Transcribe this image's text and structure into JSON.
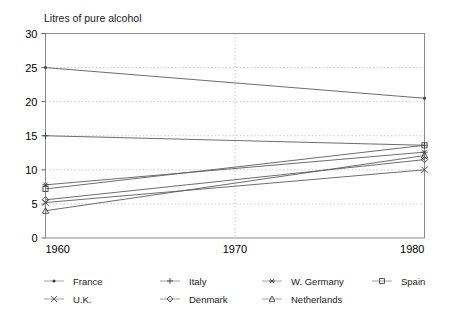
{
  "chart_data": {
    "type": "line",
    "title": "Litres of pure alcohol",
    "xlabel": "",
    "ylabel": "Litres of pure alcohol",
    "x": [
      1960,
      1980
    ],
    "xticks": [
      1960,
      1970,
      1980
    ],
    "yticks": [
      0,
      5,
      10,
      15,
      20,
      25,
      30
    ],
    "xlim": [
      1960,
      1980
    ],
    "ylim": [
      0,
      30
    ],
    "grid": true,
    "legend_position": "bottom",
    "series": [
      {
        "name": "France",
        "marker": "dot",
        "values": [
          25.0,
          20.5
        ]
      },
      {
        "name": "Italy",
        "marker": "plus",
        "values": [
          15.0,
          13.6
        ]
      },
      {
        "name": "W. Germany",
        "marker": "asterisk",
        "values": [
          7.8,
          12.6
        ]
      },
      {
        "name": "Spain",
        "marker": "square",
        "values": [
          7.2,
          13.6
        ]
      },
      {
        "name": "U.K.",
        "marker": "cross",
        "values": [
          5.2,
          10.0
        ]
      },
      {
        "name": "Denmark",
        "marker": "diamond",
        "values": [
          5.6,
          11.5
        ]
      },
      {
        "name": "Netherlands",
        "marker": "triangle",
        "values": [
          4.0,
          12.1
        ]
      }
    ]
  },
  "axis": {
    "title": "Litres of pure alcohol",
    "y_tick_labels": [
      "30",
      "25",
      "20",
      "15",
      "10",
      "5",
      "0"
    ],
    "x_tick_labels": [
      "1960",
      "1970",
      "1980"
    ]
  },
  "legend": {
    "row1": [
      {
        "label": "France",
        "marker": "dot"
      },
      {
        "label": "Italy",
        "marker": "plus"
      },
      {
        "label": "W. Germany",
        "marker": "asterisk"
      },
      {
        "label": "Spain",
        "marker": "square"
      }
    ],
    "row2": [
      {
        "label": "U.K.",
        "marker": "cross"
      },
      {
        "label": "Denmark",
        "marker": "diamond"
      },
      {
        "label": "Netherlands",
        "marker": "triangle"
      }
    ]
  },
  "colors": {
    "line": "#5c5c5c",
    "frame": "#8a8a8a",
    "grid": "#b9b9b9",
    "text": "#1a1a1a"
  }
}
